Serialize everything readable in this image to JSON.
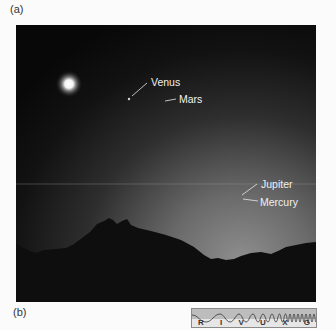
{
  "panels": {
    "a_label": "(a)",
    "b_label": "(b)"
  },
  "photo": {
    "description": "Twilight sky over a mountain silhouette with bright Moon and planets",
    "sky_top_color": "#0b0b0b",
    "sky_horizon_color": "#8a8a8a",
    "mountain_color": "#0e0e0e",
    "labels": {
      "venus": "Venus",
      "mars": "Mars",
      "jupiter": "Jupiter",
      "mercury": "Mercury"
    }
  },
  "spectrum_bar": {
    "bands": [
      "R",
      "I",
      "V",
      "U",
      "X",
      "G"
    ],
    "highlighted_band": "V"
  }
}
